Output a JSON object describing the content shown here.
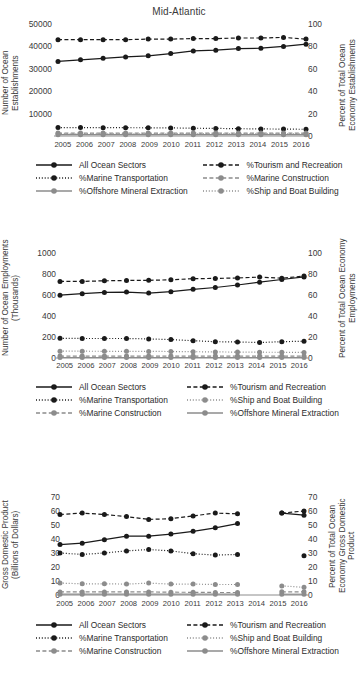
{
  "figure": {
    "title": "Mid-Atlantic",
    "series_names": {
      "all": "All Ocean Sectors",
      "tourism": "%Tourism and Recreation",
      "transport": "%Marine Transportation",
      "construction": "%Marine Construction",
      "offshore": "%Offshore Mineral Extraction",
      "ship": "%Ship and Boat Building"
    },
    "colors": {
      "black": "#1a1a1a",
      "gray": "#8c8c8c",
      "text": "#3a3a3a"
    }
  },
  "chart_data": [
    {
      "id": "establishments",
      "type": "line",
      "title": "Mid-Atlantic",
      "xlabel": "",
      "ylabel": "Number of Ocean Establishments",
      "y2label": "Percent of Total Ocean Economy Establishments",
      "x": [
        2005,
        2006,
        2007,
        2008,
        2009,
        2010,
        2011,
        2012,
        2013,
        2014,
        2015,
        2016
      ],
      "xtick_labels": [
        "2005",
        "2006",
        "2007",
        "2008",
        "2009",
        "2010",
        "2011",
        "2012",
        "2013",
        "2014",
        "2015",
        "2016"
      ],
      "ylim": [
        0,
        50000
      ],
      "ytick_labels": [
        "10000",
        "20000",
        "30000",
        "40000",
        "50000"
      ],
      "yticks": [
        10000,
        20000,
        30000,
        40000,
        50000
      ],
      "y2lim": [
        0,
        100
      ],
      "y2tick_labels": [
        "0",
        "20",
        "40",
        "60",
        "80",
        "100"
      ],
      "y2ticks": [
        0,
        20,
        40,
        60,
        80,
        100
      ],
      "grid": false,
      "legend_position": "below",
      "series": [
        {
          "name": "All Ocean Sectors",
          "axis": "left",
          "color": "#1a1a1a",
          "style": "solid",
          "values": [
            33300,
            34000,
            34700,
            35300,
            35800,
            36800,
            38000,
            38300,
            39000,
            39200,
            40000,
            41000
          ]
        },
        {
          "name": "%Tourism and Recreation",
          "axis": "right",
          "color": "#1a1a1a",
          "style": "dashed",
          "values": [
            86,
            86,
            86,
            86,
            86.5,
            86.5,
            87,
            87,
            87.5,
            87.5,
            88,
            86.5
          ]
        },
        {
          "name": "%Marine Transportation",
          "axis": "right",
          "color": "#1a1a1a",
          "style": "dotted",
          "values": [
            7.5,
            7.5,
            7.4,
            7.4,
            7.3,
            7.2,
            7.0,
            6.8,
            6.5,
            6.3,
            6.2,
            6.0
          ]
        },
        {
          "name": "%Marine Construction",
          "axis": "right",
          "color": "#8c8c8c",
          "style": "dashed",
          "values": [
            2.6,
            2.6,
            2.6,
            2.6,
            2.6,
            2.6,
            2.6,
            2.6,
            2.6,
            2.6,
            2.6,
            2.6
          ]
        },
        {
          "name": "%Offshore Mineral Extraction",
          "axis": "right",
          "color": "#8c8c8c",
          "style": "solid",
          "values": [
            1.2,
            1.2,
            1.2,
            1.2,
            1.2,
            1.2,
            1.2,
            1.2,
            1.2,
            1.2,
            1.2,
            1.2
          ]
        },
        {
          "name": "%Ship and Boat Building",
          "axis": "right",
          "color": "#8c8c8c",
          "style": "dotted",
          "values": [
            2.0,
            2.0,
            2.0,
            2.0,
            2.0,
            2.0,
            2.0,
            2.0,
            2.0,
            2.0,
            2.0,
            2.0
          ]
        }
      ],
      "legend": [
        {
          "label": "All Ocean Sectors",
          "color": "#1a1a1a",
          "style": "solid"
        },
        {
          "label": "%Tourism and Recreation",
          "color": "#1a1a1a",
          "style": "dashed"
        },
        {
          "label": "%Marine Transportation",
          "color": "#1a1a1a",
          "style": "dotted"
        },
        {
          "label": "%Marine Construction",
          "color": "#8c8c8c",
          "style": "dashed"
        },
        {
          "label": "%Offshore Mineral Extraction",
          "color": "#8c8c8c",
          "style": "solid"
        },
        {
          "label": "%Ship and Boat Building",
          "color": "#8c8c8c",
          "style": "dotted"
        }
      ]
    },
    {
      "id": "employments",
      "type": "line",
      "title": "",
      "xlabel": "",
      "ylabel": "Number of Ocean Employments (Thousands)",
      "y2label": "Percent of Total Ocean Economy Employments",
      "x": [
        2005,
        2006,
        2007,
        2008,
        2009,
        2010,
        2011,
        2012,
        2013,
        2014,
        2015,
        2016
      ],
      "xtick_labels": [
        "2005",
        "2006",
        "2007",
        "2008",
        "2009",
        "2010",
        "2011",
        "2012",
        "2013",
        "2014",
        "2015",
        "2016"
      ],
      "ylim": [
        0,
        1000
      ],
      "ytick_labels": [
        "0",
        "200",
        "400",
        "600",
        "800",
        "1000"
      ],
      "yticks": [
        0,
        200,
        400,
        600,
        800,
        1000
      ],
      "y2lim": [
        0,
        100
      ],
      "y2tick_labels": [
        "0",
        "20",
        "40",
        "60",
        "80",
        "100"
      ],
      "y2ticks": [
        0,
        20,
        40,
        60,
        80,
        100
      ],
      "grid": false,
      "legend_position": "below",
      "series": [
        {
          "name": "All Ocean Sectors",
          "axis": "left",
          "color": "#1a1a1a",
          "style": "solid",
          "values": [
            598,
            612,
            625,
            628,
            618,
            631,
            654,
            671,
            695,
            722,
            748,
            772
          ]
        },
        {
          "name": "%Tourism and Recreation",
          "axis": "right",
          "color": "#1a1a1a",
          "style": "dashed",
          "values": [
            73,
            73,
            73.5,
            73.8,
            74,
            74.5,
            75.5,
            75.8,
            76.2,
            77,
            76,
            78
          ]
        },
        {
          "name": "%Marine Transportation",
          "axis": "right",
          "color": "#1a1a1a",
          "style": "dotted",
          "values": [
            18.8,
            18.6,
            18.6,
            18.6,
            18.2,
            17.5,
            16.5,
            15.5,
            15.2,
            14.8,
            15.5,
            16.0
          ]
        },
        {
          "name": "%Ship and Boat Building",
          "axis": "right",
          "color": "#8c8c8c",
          "style": "dotted",
          "values": [
            6.5,
            6.5,
            6.4,
            6.4,
            6.3,
            6.2,
            6.0,
            5.8,
            5.6,
            5.5,
            5.4,
            5.3
          ]
        },
        {
          "name": "%Marine Construction",
          "axis": "right",
          "color": "#8c8c8c",
          "style": "dashed",
          "values": [
            1.8,
            1.8,
            1.8,
            1.8,
            1.8,
            1.8,
            1.8,
            1.8,
            1.8,
            1.8,
            1.8,
            1.8
          ]
        },
        {
          "name": "%Offshore Mineral Extraction",
          "axis": "right",
          "color": "#8c8c8c",
          "style": "solid",
          "values": [
            0.5,
            0.5,
            0.5,
            0.5,
            0.5,
            0.5,
            0.5,
            0.5,
            0.5,
            0.5,
            0.5,
            0.5
          ]
        }
      ],
      "legend": [
        {
          "label": "All Ocean Sectors",
          "color": "#1a1a1a",
          "style": "solid"
        },
        {
          "label": "%Tourism and Recreation",
          "color": "#1a1a1a",
          "style": "dashed"
        },
        {
          "label": "%Marine Transportation",
          "color": "#1a1a1a",
          "style": "dotted"
        },
        {
          "label": "%Ship and Boat Building",
          "color": "#8c8c8c",
          "style": "dotted"
        },
        {
          "label": "%Marine Construction",
          "color": "#8c8c8c",
          "style": "dashed"
        },
        {
          "label": "%Offshore Mineral Extraction",
          "color": "#8c8c8c",
          "style": "solid"
        }
      ]
    },
    {
      "id": "gdp",
      "type": "line",
      "title": "",
      "xlabel": "",
      "ylabel": "Gross Domestic Product (Billions of Dollars)",
      "y2label": "Percent of Total Ocean Economy Gross Domestic Product",
      "x": [
        2005,
        2006,
        2007,
        2008,
        2009,
        2010,
        2011,
        2012,
        2013,
        2014,
        2015,
        2016
      ],
      "xtick_labels": [
        "2005",
        "2006",
        "2007",
        "2008",
        "2009",
        "2010",
        "2011",
        "2012",
        "2013",
        "2014",
        "2015",
        "2016"
      ],
      "ylim": [
        0,
        70
      ],
      "ytick_labels": [
        "0",
        "10",
        "20",
        "30",
        "40",
        "50",
        "60",
        "70"
      ],
      "yticks": [
        0,
        10,
        20,
        30,
        40,
        50,
        60,
        70
      ],
      "y2lim": [
        0,
        70
      ],
      "y2tick_labels": [
        "0",
        "10",
        "20",
        "30",
        "40",
        "50",
        "60",
        "70"
      ],
      "y2ticks": [
        0,
        10,
        20,
        30,
        40,
        50,
        60,
        70
      ],
      "grid": false,
      "legend_position": "below",
      "note": "2014 data missing for all series",
      "series": [
        {
          "name": "All Ocean Sectors",
          "axis": "left",
          "color": "#1a1a1a",
          "style": "solid",
          "values": [
            36,
            37,
            39.5,
            42,
            42,
            43.5,
            45.5,
            48,
            51,
            null,
            58.5,
            57
          ]
        },
        {
          "name": "%Tourism and Recreation",
          "axis": "right",
          "color": "#1a1a1a",
          "style": "dashed",
          "values": [
            57.5,
            58.5,
            57.5,
            56,
            54,
            54.5,
            56.5,
            58.5,
            58,
            null,
            58.5,
            60
          ]
        },
        {
          "name": "%Marine Transportation",
          "axis": "right",
          "color": "#1a1a1a",
          "style": "dotted",
          "values": [
            30,
            29,
            30,
            31.5,
            32.5,
            31.5,
            29.5,
            28.5,
            29,
            null,
            null,
            28
          ]
        },
        {
          "name": "%Ship and Boat Building",
          "axis": "right",
          "color": "#8c8c8c",
          "style": "dotted",
          "values": [
            8.5,
            8,
            8,
            7.8,
            8.5,
            7.8,
            7.8,
            7.5,
            7.5,
            null,
            6.5,
            5.5
          ]
        },
        {
          "name": "%Marine Construction",
          "axis": "right",
          "color": "#8c8c8c",
          "style": "dashed",
          "values": [
            2.2,
            2.2,
            2.2,
            2.2,
            2.2,
            2.0,
            1.9,
            1.8,
            1.8,
            null,
            2.3,
            2.3
          ]
        },
        {
          "name": "%Offshore Mineral Extraction",
          "axis": "right",
          "color": "#8c8c8c",
          "style": "solid",
          "values": [
            0.6,
            0.6,
            0.6,
            0.6,
            0.6,
            0.6,
            0.6,
            0.6,
            0.6,
            null,
            0.6,
            0.6
          ]
        }
      ],
      "legend": [
        {
          "label": "All Ocean Sectors",
          "color": "#1a1a1a",
          "style": "solid"
        },
        {
          "label": "%Tourism and Recreation",
          "color": "#1a1a1a",
          "style": "dashed"
        },
        {
          "label": "%Marine Transportation",
          "color": "#1a1a1a",
          "style": "dotted"
        },
        {
          "label": "%Ship and Boat Building",
          "color": "#8c8c8c",
          "style": "dotted"
        },
        {
          "label": "%Marine Construction",
          "color": "#8c8c8c",
          "style": "dashed"
        },
        {
          "label": "%Offshore Mineral Extraction",
          "color": "#8c8c8c",
          "style": "solid"
        }
      ]
    }
  ]
}
